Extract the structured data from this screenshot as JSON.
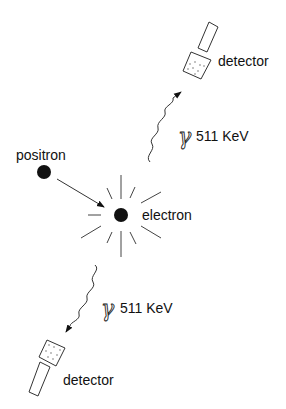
{
  "diagram": {
    "colors": {
      "ink": "#111111",
      "line": "#333333",
      "background": "#ffffff"
    },
    "particles": {
      "positron": {
        "label": "positron",
        "icon": "filled-circle"
      },
      "electron": {
        "label": "electron",
        "icon": "filled-circle"
      }
    },
    "annihilation": {
      "icon": "starburst-rays",
      "ray_count": 12
    },
    "photons": [
      {
        "id": "top",
        "symbol": "γ",
        "energy": "511 KeV",
        "direction": "up-right"
      },
      {
        "id": "bottom",
        "symbol": "γ",
        "energy": "511 KeV",
        "direction": "down-left"
      }
    ],
    "detectors": [
      {
        "id": "top",
        "label": "detector"
      },
      {
        "id": "bottom",
        "label": "detector"
      }
    ]
  }
}
